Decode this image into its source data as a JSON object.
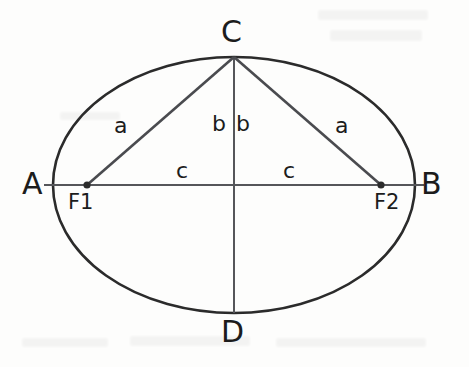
{
  "diagram": {
    "type": "geometry-figure",
    "shape": "ellipse",
    "background_color": "#fdfdfc",
    "outline_color": "#2b2b2b",
    "line_color": "#55565a",
    "text_color": "#1c1c1c",
    "geometry": {
      "center": {
        "x": 234,
        "y": 185
      },
      "semi_major_px": 181,
      "semi_minor_px": 128,
      "focus_left": {
        "x": 87,
        "y": 185
      },
      "focus_right": {
        "x": 381,
        "y": 185
      },
      "top_vertex": {
        "x": 234,
        "y": 57
      },
      "bottom_vertex": {
        "x": 234,
        "y": 313
      },
      "left_vertex": {
        "x": 53,
        "y": 185
      },
      "right_vertex": {
        "x": 415,
        "y": 185
      }
    },
    "vertex_labels": [
      {
        "name": "vertex-a",
        "text": "A",
        "x": 22,
        "y": 169
      },
      {
        "name": "vertex-b",
        "text": "B",
        "x": 421,
        "y": 169
      },
      {
        "name": "vertex-c",
        "text": "C",
        "x": 221,
        "y": 17
      },
      {
        "name": "vertex-d",
        "text": "D",
        "x": 221,
        "y": 317
      }
    ],
    "focus_labels": [
      {
        "name": "focus-label-f1",
        "text": "F1",
        "x": 68,
        "y": 192
      },
      {
        "name": "focus-label-f2",
        "text": "F2",
        "x": 374,
        "y": 192
      }
    ],
    "segment_labels": [
      {
        "name": "segment-label-a-left",
        "text": "a",
        "x": 114,
        "y": 115
      },
      {
        "name": "segment-label-b-left",
        "text": "b",
        "x": 212,
        "y": 115
      },
      {
        "name": "segment-label-b-right",
        "text": "b",
        "x": 235,
        "y": 115
      },
      {
        "name": "segment-label-a-right",
        "text": "a",
        "x": 335,
        "y": 115
      },
      {
        "name": "segment-label-c-left",
        "text": "c",
        "x": 176,
        "y": 162
      },
      {
        "name": "segment-label-c-right",
        "text": "c",
        "x": 283,
        "y": 162
      }
    ]
  }
}
